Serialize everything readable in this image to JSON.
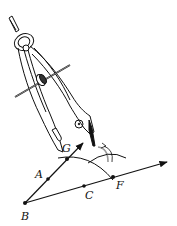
{
  "diagram": {
    "colors": {
      "ink": "#111111",
      "arc_gray": "#999999",
      "background": "#ffffff"
    },
    "points": [
      {
        "id": "B",
        "label": "B",
        "x": 25,
        "y": 203,
        "label_x": 21,
        "label_y": 220
      },
      {
        "id": "A",
        "label": "A",
        "x": 48,
        "y": 179,
        "label_x": 35,
        "label_y": 178
      },
      {
        "id": "G",
        "label": "G",
        "x": 67,
        "y": 159,
        "label_x": 62,
        "label_y": 152
      },
      {
        "id": "C",
        "label": "C",
        "x": 84,
        "y": 186,
        "label_x": 85,
        "label_y": 199
      },
      {
        "id": "F",
        "label": "F",
        "x": 113,
        "y": 177,
        "label_x": 116,
        "label_y": 189
      }
    ],
    "rays": [
      {
        "id": "ray-BG",
        "from": "B",
        "to_x": 83,
        "to_y": 143
      },
      {
        "id": "ray-BF",
        "from": "B",
        "to_x": 167,
        "to_y": 162
      }
    ],
    "arcs": [
      {
        "id": "arc-through-G-F",
        "d": "M58 158 Q90 152 113 180"
      },
      {
        "id": "arc-from-F-side",
        "d": "M88 163 Q108 148 126 158"
      }
    ],
    "compass": {
      "description": "Drafting compass with pivot ring, adjustment screw and pencil leg"
    }
  }
}
